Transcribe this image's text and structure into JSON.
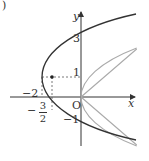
{
  "diagram": {
    "type": "coordinate-graph",
    "axes": {
      "x_label": "x",
      "y_label": "y",
      "origin_label": "O"
    },
    "curves": [
      {
        "name": "dark-parabola",
        "equation": "x = (y-1)^2/2 - 2",
        "vertex": [
          -2,
          1
        ],
        "color": "#333333"
      },
      {
        "name": "gray-parabola",
        "equation": "x = y^2/2",
        "vertex": [
          0,
          0
        ],
        "color": "#aaaaaa"
      }
    ],
    "labels": {
      "y3": "3",
      "y1": "1",
      "yneg1": "−1",
      "xneg2": "−2",
      "frac_sign": "−",
      "frac_num": "3",
      "frac_den": "2",
      "corner": ")"
    }
  }
}
